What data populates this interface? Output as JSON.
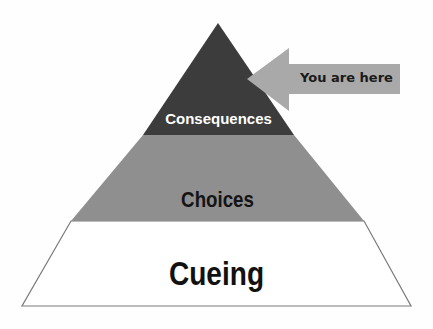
{
  "diagram": {
    "type": "pyramid",
    "levels": [
      {
        "label": "Consequences",
        "position": "top",
        "fill": "#3c3c3c",
        "text_color": "#ffffff"
      },
      {
        "label": "Choices",
        "position": "middle",
        "fill": "#8f8f8f",
        "text_color": "#141414"
      },
      {
        "label": "Cueing",
        "position": "bottom",
        "fill": "#ffffff",
        "text_color": "#111111"
      }
    ],
    "pointer": {
      "label": "You are here",
      "fill": "#a9a9a9",
      "text_color": "#1a1a1a",
      "points_to": "Consequences"
    },
    "outline_color": "#7a7a7a"
  }
}
